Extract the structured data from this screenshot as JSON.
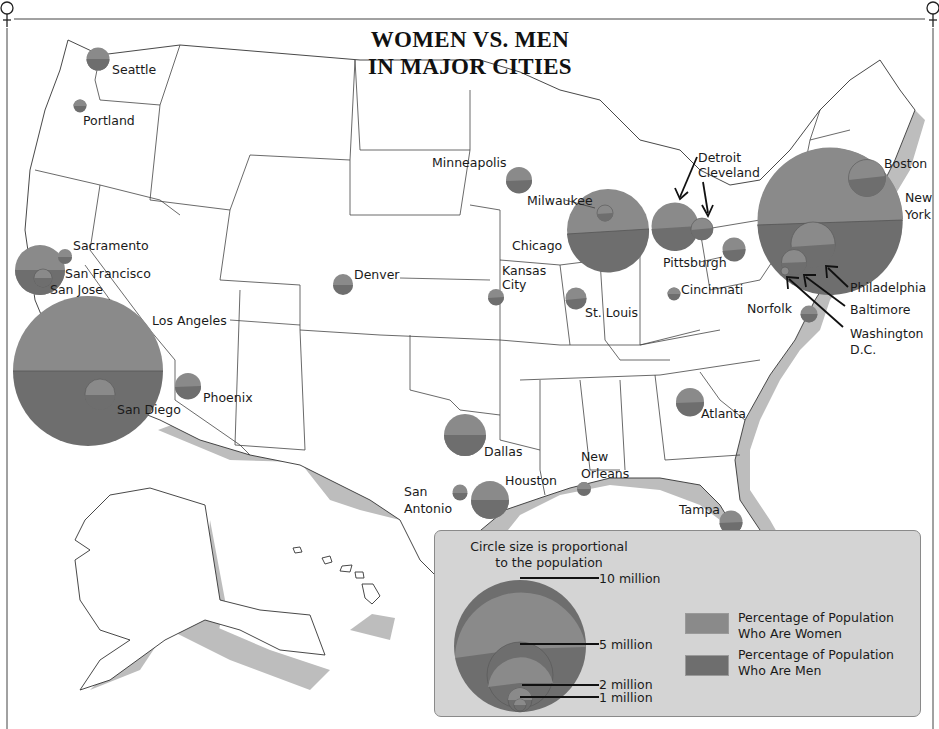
{
  "title": {
    "line1": "WOMEN VS. MEN",
    "line2": "IN MAJOR CITIES"
  },
  "colors": {
    "women": "#8a8a8a",
    "men": "#6e6e6e",
    "coast_shadow": "#bdbdbd",
    "legend_bg": "#d4d4d4",
    "land": "#ffffff",
    "border": "#333333"
  },
  "corner_symbols": {
    "top_left": "♀",
    "top_right": "♀"
  },
  "cities": [
    {
      "name": "Seattle",
      "label": "Seattle"
    },
    {
      "name": "Portland",
      "label": "Portland"
    },
    {
      "name": "Sacramento",
      "label": "Sacramento"
    },
    {
      "name": "San Francisco",
      "label": "San Francisco"
    },
    {
      "name": "San Jose",
      "label": "San Jose"
    },
    {
      "name": "Los Angeles",
      "label": "Los Angeles"
    },
    {
      "name": "San Diego",
      "label": "San Diego"
    },
    {
      "name": "Phoenix",
      "label": "Phoenix"
    },
    {
      "name": "Denver",
      "label": "Denver"
    },
    {
      "name": "Minneapolis",
      "label": "Minneapolis"
    },
    {
      "name": "Milwaukee",
      "label": "Milwaukee"
    },
    {
      "name": "Chicago",
      "label": "Chicago"
    },
    {
      "name": "Kansas City",
      "label": "Kansas City",
      "label_lines": [
        "Kansas",
        "City"
      ]
    },
    {
      "name": "St. Louis",
      "label": "St. Louis"
    },
    {
      "name": "Detroit",
      "label": "Detroit"
    },
    {
      "name": "Cleveland",
      "label": "Cleveland"
    },
    {
      "name": "Pittsburgh",
      "label": "Pittsburgh"
    },
    {
      "name": "Cincinnati",
      "label": "Cincinnati"
    },
    {
      "name": "Boston",
      "label": "Boston"
    },
    {
      "name": "New York",
      "label": "New York",
      "label_lines": [
        "New",
        "York"
      ]
    },
    {
      "name": "Philadelphia",
      "label": "Philadelphia"
    },
    {
      "name": "Baltimore",
      "label": "Baltimore"
    },
    {
      "name": "Washington D.C.",
      "label": "Washington D.C.",
      "label_lines": [
        "Washington",
        "D.C."
      ]
    },
    {
      "name": "Norfolk",
      "label": "Norfolk"
    },
    {
      "name": "Atlanta",
      "label": "Atlanta"
    },
    {
      "name": "Dallas",
      "label": "Dallas"
    },
    {
      "name": "Houston",
      "label": "Houston"
    },
    {
      "name": "San Antonio",
      "label": "San Antonio",
      "label_lines": [
        "San",
        "Antonio"
      ]
    },
    {
      "name": "New Orleans",
      "label": "New Orleans",
      "label_lines": [
        "New",
        "Orleans"
      ]
    },
    {
      "name": "Tampa",
      "label": "Tampa"
    },
    {
      "name": "Miami",
      "label": "Miami"
    }
  ],
  "legend": {
    "size_note_line1": "Circle size is proportional",
    "size_note_line2": "to the population",
    "size_scale": [
      "10 million",
      "5 million",
      "2 million",
      "1 million"
    ],
    "women_label_line1": "Percentage of Population",
    "women_label_line2": "Who Are Women",
    "men_label_line1": "Percentage of Population",
    "men_label_line2": "Who Are Men"
  }
}
